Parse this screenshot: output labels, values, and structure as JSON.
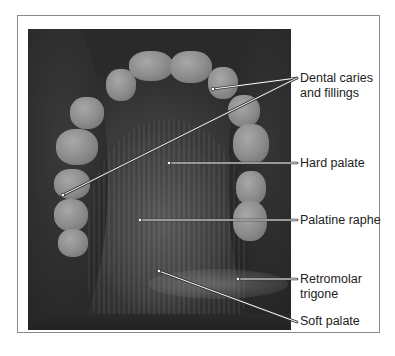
{
  "figure": {
    "labels": [
      {
        "id": "dental-caries",
        "lines": [
          "Dental caries",
          "and fillings"
        ],
        "points": [
          [
            213,
            89
          ],
          [
            63,
            195
          ]
        ],
        "anchor": [
          297,
          78
        ]
      },
      {
        "id": "hard-palate",
        "lines": [
          "Hard palate"
        ],
        "points": [
          [
            169,
            163
          ]
        ],
        "anchor": [
          297,
          163
        ]
      },
      {
        "id": "palatine-raphe",
        "lines": [
          "Palatine raphe"
        ],
        "points": [
          [
            140,
            220
          ]
        ],
        "anchor": [
          297,
          220
        ]
      },
      {
        "id": "retromolar-trigone",
        "lines": [
          "Retromolar",
          "trigone"
        ],
        "points": [
          [
            238,
            279
          ]
        ],
        "anchor": [
          297,
          279
        ]
      },
      {
        "id": "soft-palate",
        "lines": [
          "Soft palate"
        ],
        "points": [
          [
            159,
            271
          ]
        ],
        "anchor": [
          297,
          322
        ]
      }
    ],
    "colors": {
      "frame": "#8a8a8a",
      "leader": "#ffffff",
      "leader_outline": "#333333",
      "text": "#222222"
    }
  }
}
